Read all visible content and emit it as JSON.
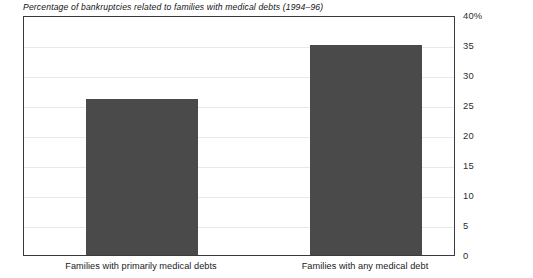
{
  "chart_data": {
    "type": "bar",
    "title": "Percentage of bankruptcies related to families with medical debts (1994–96)",
    "xlabel": "",
    "ylabel": "",
    "categories": [
      "Families with primarily medical debts",
      "Families with any medical debt"
    ],
    "values": [
      26,
      35
    ],
    "ylim": [
      0,
      40
    ],
    "yticks": [
      0,
      5,
      10,
      15,
      20,
      25,
      30,
      35,
      40
    ],
    "ytick_labels": [
      "0",
      "5",
      "10",
      "15",
      "20",
      "25",
      "30",
      "35",
      "40%"
    ],
    "y_axis_position": "right",
    "grid": true,
    "grid_axis": "y",
    "legend": "none",
    "bar_color": "#4a4a4a",
    "gridline_color": "#e9e9e9",
    "frame_color": "#3a3a3a",
    "background_color": "#ffffff"
  }
}
